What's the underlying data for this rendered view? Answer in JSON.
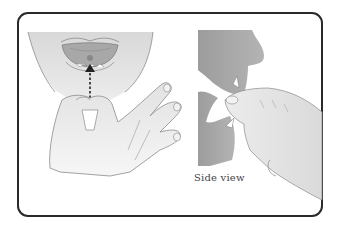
{
  "figure": {
    "panels": [
      {
        "id": "front",
        "label": ""
      },
      {
        "id": "side",
        "label": "Side view"
      }
    ]
  },
  "colors": {
    "border": "#2a2a2a",
    "skin_light": "#e6e6e6",
    "skin_mid": "#cfcfcf",
    "skin_dark": "#9a9a9a",
    "mouth": "#a8a8a8",
    "tablet": "#888888"
  }
}
